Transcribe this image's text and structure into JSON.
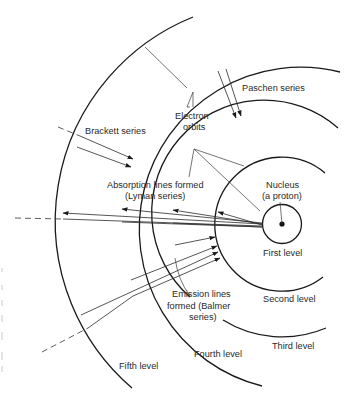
{
  "diagram": {
    "type": "hydrogen-atom-energy-levels",
    "labels": {
      "paschen": "Paschen series",
      "electron_orbits_1": "Electron",
      "electron_orbits_2": "orbits",
      "brackett": "Brackett series",
      "absorption_1": "Absorption lines formed",
      "absorption_2": "(Lyman series)",
      "nucleus_1": "Nucleus",
      "nucleus_2": "(a proton)",
      "first_level": "First level",
      "second_level": "Second level",
      "third_level": "Third level",
      "fourth_level": "Fourth level",
      "fifth_level": "Fifth level",
      "emission_1": "Emission lines",
      "emission_2": "formed (Balmer",
      "emission_3": "series)"
    },
    "levels": [
      {
        "name": "First level",
        "radius": 19.5
      },
      {
        "name": "Second level",
        "radius": 67
      },
      {
        "name": "Third level",
        "radius": 112
      },
      {
        "name": "Fourth level",
        "radius": 161
      },
      {
        "name": "Fifth level",
        "radius": 220
      }
    ],
    "series": [
      {
        "name": "Lyman series",
        "kind": "absorption"
      },
      {
        "name": "Balmer series",
        "kind": "emission"
      },
      {
        "name": "Paschen series",
        "kind": "transition"
      },
      {
        "name": "Brackett series",
        "kind": "transition"
      }
    ],
    "colors": {
      "ink": "#1a1a1a",
      "background": "#ffffff"
    }
  }
}
